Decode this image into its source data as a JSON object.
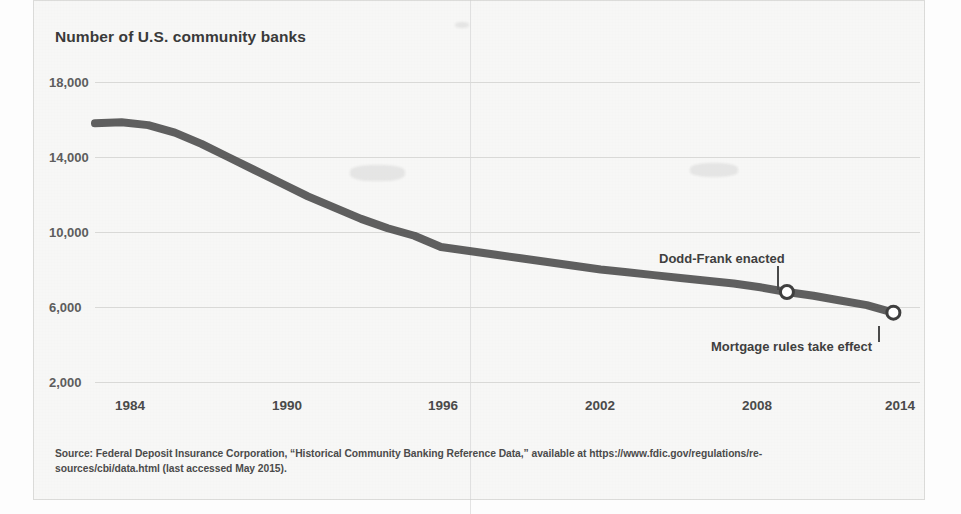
{
  "figure": {
    "title": "Number of U.S. community banks",
    "source_line_1": "Source: Federal Deposit Insurance Corporation, “Historical Community Banking Reference Data,” available at https://www.fdic.gov/regulations/re-",
    "source_line_2": "sources/cbi/data.html (last accessed May 2015)."
  },
  "chart_data": {
    "type": "line",
    "title": "Number of U.S. community banks",
    "xlabel": "",
    "ylabel": "Number of U.S. community banks",
    "xlim": [
      1984,
      2015
    ],
    "ylim": [
      2000,
      18000
    ],
    "grid": true,
    "legend": "none",
    "x_ticks": [
      "1984",
      "1990",
      "1996",
      "2002",
      "2008",
      "2014"
    ],
    "x_tick_values": [
      1984,
      1990,
      1996,
      2002,
      2008,
      2014
    ],
    "y_ticks": [
      "2,000",
      "6,000",
      "10,000",
      "14,000",
      "18,000"
    ],
    "y_tick_values": [
      2000,
      6000,
      10000,
      14000,
      18000
    ],
    "series": [
      {
        "name": "U.S. community banks",
        "color": "#4a4a4a",
        "x": [
          1984,
          1985,
          1986,
          1987,
          1988,
          1989,
          1990,
          1991,
          1992,
          1993,
          1994,
          1995,
          1996,
          1997,
          1998,
          1999,
          2000,
          2001,
          2002,
          2003,
          2004,
          2005,
          2006,
          2007,
          2008,
          2009,
          2010,
          2011,
          2012,
          2013,
          2014
        ],
        "values": [
          15800,
          15850,
          15700,
          15300,
          14700,
          14000,
          13300,
          12600,
          11900,
          11300,
          10700,
          10200,
          9800,
          9200,
          9000,
          8800,
          8600,
          8400,
          8200,
          8000,
          7850,
          7700,
          7550,
          7400,
          7250,
          7050,
          6800,
          6600,
          6350,
          6100,
          5700
        ]
      }
    ],
    "annotations": [
      {
        "label": "Dodd-Frank enacted",
        "x": 2010,
        "y": 6800,
        "marker": "open-circle",
        "leader": "down"
      },
      {
        "label": "Mortgage rules take effect",
        "x": 2014,
        "y": 5700,
        "marker": "open-circle",
        "leader": "up"
      }
    ]
  },
  "colors": {
    "line": "#4a4a4a",
    "grid": "#d9d9d7",
    "text": "#3f3f3f",
    "page": "#f7f7f6"
  }
}
